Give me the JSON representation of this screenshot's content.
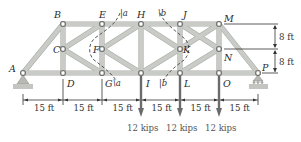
{
  "diagram": {
    "joints": [
      {
        "id": "A",
        "x": 23,
        "y": 73,
        "lx": 9,
        "ly": 72
      },
      {
        "id": "B",
        "x": 63,
        "y": 24,
        "lx": 54,
        "ly": 18
      },
      {
        "id": "C",
        "x": 63,
        "y": 49,
        "lx": 53,
        "ly": 53
      },
      {
        "id": "D",
        "x": 63,
        "y": 73,
        "lx": 67,
        "ly": 87
      },
      {
        "id": "E",
        "x": 102,
        "y": 24,
        "lx": 99,
        "ly": 18
      },
      {
        "id": "F",
        "x": 102,
        "y": 49,
        "lx": 93,
        "ly": 53
      },
      {
        "id": "G",
        "x": 102,
        "y": 73,
        "lx": 105,
        "ly": 87
      },
      {
        "id": "H",
        "x": 141,
        "y": 24,
        "lx": 137,
        "ly": 18
      },
      {
        "id": "I",
        "x": 141,
        "y": 73,
        "lx": 146,
        "ly": 87
      },
      {
        "id": "J",
        "x": 180,
        "y": 24,
        "lx": 183,
        "ly": 18
      },
      {
        "id": "K",
        "x": 180,
        "y": 49,
        "lx": 183,
        "ly": 53
      },
      {
        "id": "L",
        "x": 180,
        "y": 73,
        "lx": 184,
        "ly": 87
      },
      {
        "id": "M",
        "x": 219,
        "y": 24,
        "lx": 224,
        "ly": 22
      },
      {
        "id": "N",
        "x": 219,
        "y": 49,
        "lx": 224,
        "ly": 61
      },
      {
        "id": "O",
        "x": 219,
        "y": 73,
        "lx": 223,
        "ly": 87
      },
      {
        "id": "P",
        "x": 258,
        "y": 73,
        "lx": 262,
        "ly": 71
      }
    ],
    "members": [
      [
        "A",
        "B"
      ],
      [
        "A",
        "D"
      ],
      [
        "B",
        "E"
      ],
      [
        "B",
        "C"
      ],
      [
        "C",
        "D"
      ],
      [
        "C",
        "E"
      ],
      [
        "D",
        "G"
      ],
      [
        "E",
        "F"
      ],
      [
        "F",
        "G"
      ],
      [
        "E",
        "H"
      ],
      [
        "C",
        "G"
      ],
      [
        "F",
        "H"
      ],
      [
        "F",
        "I"
      ],
      [
        "G",
        "I"
      ],
      [
        "H",
        "I"
      ],
      [
        "H",
        "J"
      ],
      [
        "H",
        "K"
      ],
      [
        "I",
        "K"
      ],
      [
        "I",
        "L"
      ],
      [
        "J",
        "K"
      ],
      [
        "K",
        "L"
      ],
      [
        "J",
        "M"
      ],
      [
        "K",
        "M"
      ],
      [
        "N",
        "J"
      ],
      [
        "N",
        "L"
      ],
      [
        "L",
        "O"
      ],
      [
        "M",
        "N"
      ],
      [
        "N",
        "O"
      ],
      [
        "M",
        "P"
      ],
      [
        "O",
        "P"
      ]
    ],
    "supports": {
      "left": {
        "type": "pin",
        "joint": "A"
      },
      "right": {
        "type": "roller",
        "joint": "P"
      }
    },
    "sections": [
      {
        "label_top": "a",
        "label_bottom": "a"
      },
      {
        "label_top": "b",
        "label_bottom": "b"
      }
    ],
    "dimensions": {
      "horizontal": [
        "15 ft",
        "15 ft",
        "15 ft",
        "15 ft",
        "15 ft",
        "15 ft"
      ],
      "vertical": [
        "8 ft",
        "8 ft"
      ]
    },
    "loads": [
      {
        "joint": "I",
        "label": "12 kips"
      },
      {
        "joint": "L",
        "label": "12 kips"
      },
      {
        "joint": "O",
        "label": "12 kips"
      }
    ]
  }
}
